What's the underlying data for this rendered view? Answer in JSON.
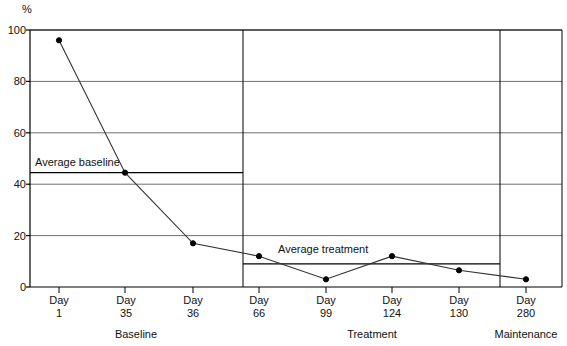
{
  "chart_data": {
    "type": "line",
    "title": "",
    "subtitle": "",
    "xlabel": "",
    "ylabel": "%",
    "ylim": [
      0,
      100
    ],
    "yticks": [
      0,
      20,
      40,
      60,
      80,
      100
    ],
    "ytick_labels": [
      "0",
      "20",
      "40",
      "60",
      "80",
      "100"
    ],
    "grid": true,
    "legend_position": "none",
    "categories": [
      "Day 1",
      "Day 35",
      "Day 36",
      "Day 66",
      "Day 99",
      "Day 124",
      "Day 130",
      "Day 280"
    ],
    "x_tick_day_word": [
      "Day",
      "Day",
      "Day",
      "Day",
      "Day",
      "Day",
      "Day",
      "Day"
    ],
    "x_tick_day_number": [
      "1",
      "35",
      "36",
      "66",
      "99",
      "124",
      "130",
      "280"
    ],
    "series": [
      {
        "name": "Percent",
        "values": [
          96,
          44.5,
          17,
          12,
          3,
          12,
          6.5,
          3
        ],
        "marker": "filled-circle",
        "color": "#000000"
      }
    ],
    "reference_lines": [
      {
        "name": "average-baseline",
        "label": "Average baseline",
        "value": 44.5,
        "span_sections": [
          "Baseline"
        ],
        "color": "#000000"
      },
      {
        "name": "average-treatment",
        "label": "Average treatment",
        "value": 9,
        "span_sections": [
          "Treatment"
        ],
        "color": "#000000"
      }
    ],
    "sections": [
      {
        "label": "Baseline",
        "points": [
          "Day 1",
          "Day 35",
          "Day 36"
        ]
      },
      {
        "label": "Treatment",
        "points": [
          "Day 66",
          "Day 99",
          "Day 124",
          "Day 130"
        ]
      },
      {
        "label": "Maintenance",
        "points": [
          "Day 280"
        ]
      }
    ],
    "section_dividers": [
      243,
      500
    ],
    "annotations": [
      {
        "name": "average-baseline-label",
        "text": "Average baseline"
      },
      {
        "name": "average-treatment-label",
        "text": "Average treatment"
      }
    ]
  },
  "colors": {
    "axis": "#000000",
    "gridline": "#6e6e6e",
    "data_line": "#333333",
    "marker": "#000000",
    "text": "#111111",
    "background": "#ffffff"
  }
}
